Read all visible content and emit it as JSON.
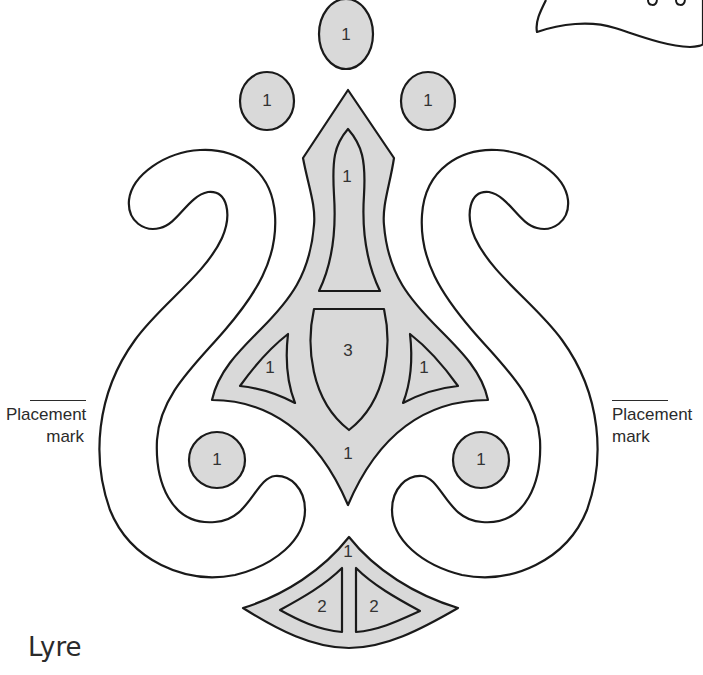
{
  "title": "Lyre",
  "placement_marks": {
    "left": {
      "line1": "Placement",
      "line2": "mark"
    },
    "right": {
      "line1": "Placement",
      "line2": "mark"
    }
  },
  "pieces": {
    "top_circle": "1",
    "upper_left_circle": "1",
    "upper_right_circle": "1",
    "flame_inner": "1",
    "shield": "3",
    "left_triangle": "1",
    "right_triangle": "1",
    "body": "1",
    "lower_left_circle": "1",
    "lower_right_circle": "1",
    "base_fan": "1",
    "base_left_triangle": "2",
    "base_right_triangle": "2"
  },
  "colors": {
    "fill": "#d9d9d9",
    "stroke": "#1a1a1a",
    "background": "#ffffff"
  }
}
